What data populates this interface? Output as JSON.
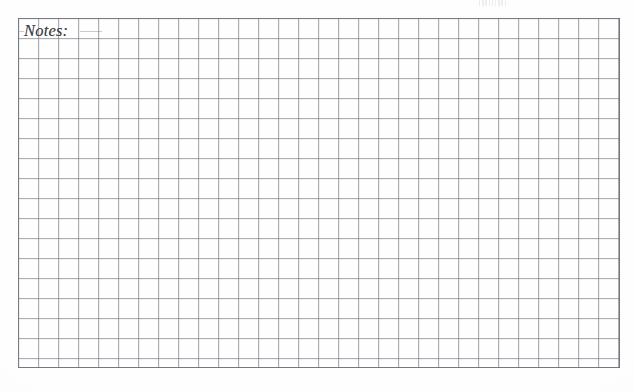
{
  "page": {
    "kind": "notes-grid-page",
    "background_color": "#fefefe",
    "width": 634,
    "height": 392
  },
  "notes_section": {
    "label": "Notes:",
    "label_color": "#3a3a3e",
    "label_style": "italic-serif",
    "content_lines": []
  },
  "grid": {
    "line_color": "#84868c",
    "frame_color": "#6c6e76",
    "cell_size_px": 20,
    "columns": 30,
    "rows": 17,
    "origin_x": 18,
    "origin_y": 18,
    "width": 602,
    "height": 350
  },
  "artifacts": {
    "top_edge_mark": {
      "name": "scan-edge-artifact",
      "x": 479,
      "y": 0,
      "width": 28,
      "height": 6
    }
  }
}
